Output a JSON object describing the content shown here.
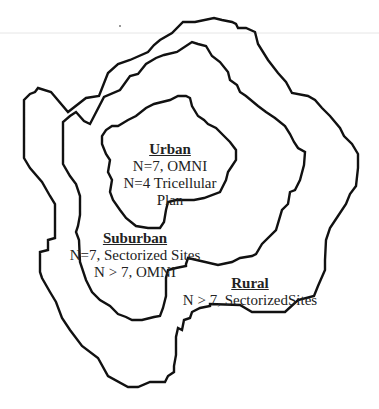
{
  "diagram": {
    "type": "nested-contour-zones",
    "zones": [
      {
        "id": "urban",
        "title": "Urban",
        "lines": [
          "N=7, OMNI",
          "N=4  Tricellular",
          "Plan"
        ]
      },
      {
        "id": "suburban",
        "title": "Suburban",
        "lines": [
          "N=7, Sectorized Sites",
          "N > 7, OMNI"
        ]
      },
      {
        "id": "rural",
        "title": "Rural",
        "lines": [
          "N > 7,  SectorizedSites"
        ]
      }
    ],
    "colors": {
      "background": "#ffffff",
      "outline": "#111111",
      "text": "#222222"
    }
  }
}
